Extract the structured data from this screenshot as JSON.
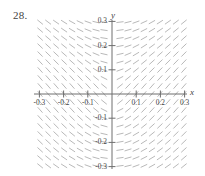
{
  "figure": {
    "number_label": "28.",
    "x_axis_name": "x",
    "y_axis_name": "y"
  },
  "chart_data": {
    "type": "scatter",
    "subtype": "slope-field",
    "title": "",
    "subtitle": "",
    "xlabel": "x",
    "ylabel": "y",
    "xlim": [
      -0.35,
      0.35
    ],
    "ylim": [
      -0.35,
      0.35
    ],
    "grid": false,
    "legend": null,
    "x_tick_labels": [
      "-0.3",
      "-0.2",
      "-0.1",
      "0.1",
      "0.2",
      "0.3"
    ],
    "x_tick_values": [
      -0.3,
      -0.2,
      -0.1,
      0.1,
      0.2,
      0.3
    ],
    "y_tick_labels": [
      "0.3",
      "0.2",
      "0.1",
      "-0.1",
      "-0.2",
      "-0.3"
    ],
    "y_tick_values": [
      0.3,
      0.2,
      0.1,
      -0.1,
      -0.2,
      -0.3
    ],
    "field": {
      "description": "Direction field of dashes; slope negative for x<0 and positive for x>0, steepness increasing toward the y-axis and decreasing with distance from the origin.",
      "grid_columns": 21,
      "grid_rows": 21,
      "x_range": [
        -0.33,
        0.33
      ],
      "y_range": [
        -0.33,
        0.33
      ],
      "segment_color": "#b9b9b9",
      "segment_length_px": 7.2
    },
    "axis_color": "#6e6e6e",
    "tick_color": "#6e6e6e"
  },
  "ticks": {
    "x": [
      {
        "label": "-0.3",
        "value": -0.3
      },
      {
        "label": "-0.2",
        "value": -0.2
      },
      {
        "label": "-0.1",
        "value": -0.1
      },
      {
        "label": "0.1",
        "value": 0.1
      },
      {
        "label": "0.2",
        "value": 0.2
      },
      {
        "label": "0.3",
        "value": 0.3
      }
    ],
    "y": [
      {
        "label": "0.3",
        "value": 0.3
      },
      {
        "label": "0.2",
        "value": 0.2
      },
      {
        "label": "0.1",
        "value": 0.1
      },
      {
        "label": "-0.1",
        "value": -0.1
      },
      {
        "label": "-0.2",
        "value": -0.2
      },
      {
        "label": "-0.3",
        "value": -0.3
      }
    ]
  }
}
